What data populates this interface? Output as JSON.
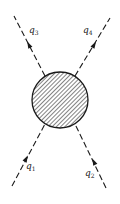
{
  "diagram": {
    "type": "feynman-scattering-vertex",
    "blob": {
      "cx": 60,
      "cy": 100,
      "r": 28,
      "fill": "hatched",
      "stroke": "#1a1a1a"
    },
    "legs": [
      {
        "id": "q1",
        "symbol": "q",
        "subscript": "1",
        "direction": "incoming",
        "from": [
          12,
          186
        ],
        "to": [
          44,
          124
        ],
        "arrow_at": [
          26,
          159
        ],
        "label_pos": [
          27,
          169
        ]
      },
      {
        "id": "q2",
        "symbol": "q",
        "subscript": "2",
        "direction": "incoming",
        "from": [
          106,
          188
        ],
        "to": [
          76,
          124
        ],
        "arrow_at": [
          94,
          162
        ],
        "label_pos": [
          86,
          176
        ]
      },
      {
        "id": "q3",
        "symbol": "q",
        "subscript": "3",
        "direction": "outgoing",
        "from": [
          44,
          76
        ],
        "to": [
          14,
          16
        ],
        "arrow_at": [
          27,
          41
        ],
        "label_pos": [
          29,
          31
        ]
      },
      {
        "id": "q4",
        "symbol": "q",
        "subscript": "4",
        "direction": "outgoing",
        "from": [
          76,
          76
        ],
        "to": [
          110,
          18
        ],
        "arrow_at": [
          96,
          42
        ],
        "label_pos": [
          83,
          31
        ]
      }
    ],
    "colors": {
      "ink": "#1a1a1a",
      "background": "#ffffff"
    }
  }
}
